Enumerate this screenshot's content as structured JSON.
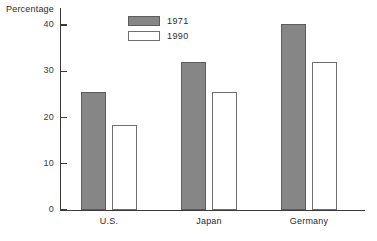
{
  "chart_data": {
    "type": "bar",
    "title": "",
    "xlabel": "",
    "ylabel": "Percentage",
    "categories": [
      "U.S.",
      "Japan",
      "Germany"
    ],
    "series": [
      {
        "name": "1971",
        "color": "#868686",
        "values": [
          25.5,
          32.0,
          40.3
        ]
      },
      {
        "name": "1990",
        "color": "#ffffff",
        "values": [
          18.3,
          25.5,
          32.0
        ]
      }
    ],
    "ylim": [
      0,
      42
    ],
    "yticks": [
      0,
      10,
      20,
      30,
      40
    ],
    "ytick_labels": [
      "0",
      "10",
      "20",
      "30",
      "40"
    ],
    "grid": false,
    "legend_position": "top-left-inside"
  },
  "axis": {
    "y_title": "Percentage"
  },
  "legend": {
    "entries": [
      {
        "label": "1971"
      },
      {
        "label": "1990"
      }
    ]
  }
}
